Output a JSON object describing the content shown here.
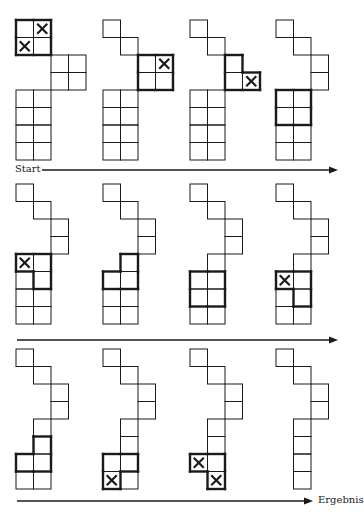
{
  "figure": {
    "start_label": "Start",
    "result_label": "Ergebnis",
    "cell_size": 17.5,
    "colors": {
      "line": "#1a1a1a",
      "background": "#ffffff"
    },
    "rows": [
      {
        "y": 20,
        "arrow": {
          "y": 170,
          "x1": 42,
          "x2": 338,
          "label": "start"
        },
        "panels": [
          {
            "x": 16,
            "cells": [
              [
                0,
                0
              ],
              [
                1,
                0
              ],
              [
                0,
                1
              ],
              [
                1,
                1
              ],
              [
                2,
                2
              ],
              [
                3,
                2
              ],
              [
                2,
                3
              ],
              [
                3,
                3
              ],
              [
                0,
                4
              ],
              [
                1,
                4
              ],
              [
                0,
                5
              ],
              [
                1,
                5
              ],
              [
                0,
                6
              ],
              [
                1,
                6
              ],
              [
                0,
                7
              ],
              [
                1,
                7
              ]
            ],
            "marked": [
              [
                1,
                0
              ],
              [
                0,
                1
              ]
            ],
            "bold": [
              [
                0,
                0
              ],
              [
                1,
                0
              ],
              [
                0,
                1
              ],
              [
                1,
                1
              ]
            ]
          },
          {
            "x": 103,
            "cells": [
              [
                0,
                0
              ],
              [
                1,
                1
              ],
              [
                2,
                2
              ],
              [
                3,
                2
              ],
              [
                2,
                3
              ],
              [
                3,
                3
              ],
              [
                0,
                4
              ],
              [
                1,
                4
              ],
              [
                0,
                5
              ],
              [
                1,
                5
              ],
              [
                0,
                6
              ],
              [
                1,
                6
              ],
              [
                0,
                7
              ],
              [
                1,
                7
              ]
            ],
            "marked": [
              [
                3,
                2
              ]
            ],
            "bold": [
              [
                2,
                2
              ],
              [
                3,
                2
              ],
              [
                2,
                3
              ],
              [
                3,
                3
              ]
            ]
          },
          {
            "x": 190,
            "cells": [
              [
                0,
                0
              ],
              [
                1,
                1
              ],
              [
                2,
                2
              ],
              [
                2,
                3
              ],
              [
                3,
                3
              ],
              [
                0,
                4
              ],
              [
                1,
                4
              ],
              [
                0,
                5
              ],
              [
                1,
                5
              ],
              [
                0,
                6
              ],
              [
                1,
                6
              ],
              [
                0,
                7
              ],
              [
                1,
                7
              ]
            ],
            "marked": [
              [
                3,
                3
              ]
            ],
            "bold": [
              [
                2,
                2
              ],
              [
                2,
                3
              ],
              [
                3,
                3
              ]
            ]
          },
          {
            "x": 276,
            "cells": [
              [
                0,
                0
              ],
              [
                1,
                1
              ],
              [
                2,
                2
              ],
              [
                2,
                3
              ],
              [
                0,
                4
              ],
              [
                1,
                4
              ],
              [
                0,
                5
              ],
              [
                1,
                5
              ],
              [
                0,
                6
              ],
              [
                1,
                6
              ],
              [
                0,
                7
              ],
              [
                1,
                7
              ]
            ],
            "marked": [],
            "bold": [
              [
                0,
                4
              ],
              [
                1,
                4
              ],
              [
                0,
                5
              ],
              [
                1,
                5
              ]
            ]
          }
        ]
      },
      {
        "y": 184,
        "arrow": {
          "y": 340,
          "x1": 17,
          "x2": 338,
          "label": ""
        },
        "panels": [
          {
            "x": 16,
            "cells": [
              [
                0,
                0
              ],
              [
                1,
                1
              ],
              [
                2,
                2
              ],
              [
                2,
                3
              ],
              [
                0,
                4
              ],
              [
                1,
                4
              ],
              [
                0,
                5
              ],
              [
                1,
                5
              ],
              [
                0,
                6
              ],
              [
                1,
                6
              ],
              [
                0,
                7
              ],
              [
                1,
                7
              ]
            ],
            "marked": [
              [
                0,
                4
              ]
            ],
            "bold": [
              [
                0,
                4
              ],
              [
                1,
                4
              ],
              [
                1,
                5
              ]
            ]
          },
          {
            "x": 103,
            "cells": [
              [
                0,
                0
              ],
              [
                1,
                1
              ],
              [
                2,
                2
              ],
              [
                2,
                3
              ],
              [
                1,
                4
              ],
              [
                0,
                5
              ],
              [
                1,
                5
              ],
              [
                0,
                6
              ],
              [
                1,
                6
              ],
              [
                0,
                7
              ],
              [
                1,
                7
              ]
            ],
            "marked": [],
            "bold": [
              [
                1,
                4
              ],
              [
                0,
                5
              ],
              [
                1,
                5
              ]
            ]
          },
          {
            "x": 190,
            "cells": [
              [
                0,
                0
              ],
              [
                1,
                1
              ],
              [
                2,
                2
              ],
              [
                2,
                3
              ],
              [
                1,
                4
              ],
              [
                0,
                5
              ],
              [
                1,
                5
              ],
              [
                0,
                6
              ],
              [
                1,
                6
              ],
              [
                0,
                7
              ],
              [
                1,
                7
              ]
            ],
            "marked": [],
            "bold": [
              [
                0,
                5
              ],
              [
                1,
                5
              ],
              [
                0,
                6
              ],
              [
                1,
                6
              ]
            ]
          },
          {
            "x": 276,
            "cells": [
              [
                0,
                0
              ],
              [
                1,
                1
              ],
              [
                2,
                2
              ],
              [
                2,
                3
              ],
              [
                1,
                4
              ],
              [
                0,
                5
              ],
              [
                1,
                5
              ],
              [
                0,
                6
              ],
              [
                1,
                6
              ],
              [
                0,
                7
              ],
              [
                1,
                7
              ]
            ],
            "marked": [
              [
                0,
                5
              ]
            ],
            "bold": [
              [
                0,
                5
              ],
              [
                1,
                5
              ],
              [
                1,
                6
              ]
            ]
          }
        ]
      },
      {
        "y": 349,
        "arrow": {
          "y": 501,
          "x1": 17,
          "x2": 313,
          "label": "result"
        },
        "panels": [
          {
            "x": 16,
            "cells": [
              [
                0,
                0
              ],
              [
                1,
                1
              ],
              [
                2,
                2
              ],
              [
                2,
                3
              ],
              [
                1,
                4
              ],
              [
                1,
                5
              ],
              [
                0,
                6
              ],
              [
                1,
                6
              ],
              [
                0,
                7
              ],
              [
                1,
                7
              ]
            ],
            "marked": [],
            "bold": [
              [
                1,
                5
              ],
              [
                0,
                6
              ],
              [
                1,
                6
              ]
            ]
          },
          {
            "x": 103,
            "cells": [
              [
                0,
                0
              ],
              [
                1,
                1
              ],
              [
                2,
                2
              ],
              [
                2,
                3
              ],
              [
                1,
                4
              ],
              [
                1,
                5
              ],
              [
                0,
                6
              ],
              [
                1,
                6
              ],
              [
                0,
                7
              ],
              [
                1,
                7
              ]
            ],
            "marked": [
              [
                0,
                7
              ]
            ],
            "bold": [
              [
                0,
                6
              ],
              [
                1,
                6
              ],
              [
                0,
                7
              ]
            ]
          },
          {
            "x": 190,
            "cells": [
              [
                0,
                0
              ],
              [
                1,
                1
              ],
              [
                2,
                2
              ],
              [
                2,
                3
              ],
              [
                1,
                4
              ],
              [
                1,
                5
              ],
              [
                0,
                6
              ],
              [
                1,
                6
              ],
              [
                1,
                7
              ]
            ],
            "marked": [
              [
                0,
                6
              ],
              [
                1,
                7
              ]
            ],
            "bold": [
              [
                0,
                6
              ],
              [
                1,
                6
              ],
              [
                1,
                7
              ]
            ]
          },
          {
            "x": 276,
            "cells": [
              [
                0,
                0
              ],
              [
                1,
                1
              ],
              [
                2,
                2
              ],
              [
                2,
                3
              ],
              [
                1,
                4
              ],
              [
                1,
                5
              ],
              [
                1,
                6
              ],
              [
                1,
                7
              ]
            ],
            "marked": [],
            "bold": []
          }
        ]
      }
    ]
  }
}
